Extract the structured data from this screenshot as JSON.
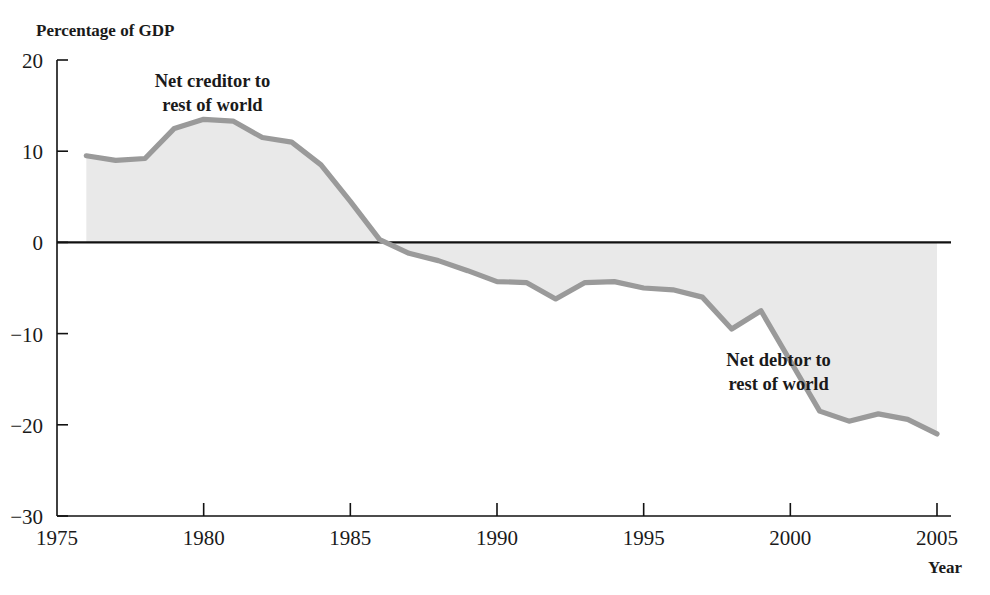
{
  "chart_data": {
    "type": "area",
    "title": "",
    "ylabel": "Percentage of GDP",
    "xlabel": "Year",
    "xlim": [
      1975,
      2005
    ],
    "ylim": [
      -30,
      20
    ],
    "grid": false,
    "legend_position": "none",
    "series_name": "U.S. net international investment position",
    "x": [
      1976,
      1977,
      1978,
      1979,
      1980,
      1981,
      1982,
      1983,
      1984,
      1985,
      1986,
      1987,
      1988,
      1989,
      1990,
      1991,
      1992,
      1993,
      1994,
      1995,
      1996,
      1997,
      1998,
      1999,
      2000,
      2001,
      2002,
      2003,
      2004,
      2005
    ],
    "values": [
      9.5,
      9.0,
      9.2,
      12.5,
      13.5,
      13.3,
      11.5,
      11.0,
      8.5,
      4.5,
      0.3,
      -1.2,
      -2.0,
      -3.1,
      -4.3,
      -4.4,
      -6.2,
      -4.4,
      -4.3,
      -5.0,
      -5.2,
      -6.0,
      -9.5,
      -7.5,
      -13.0,
      -18.5,
      -19.6,
      -18.8,
      -19.4,
      -21.0
    ],
    "y_ticks": [
      20,
      10,
      0,
      -10,
      -20,
      -30
    ],
    "y_tick_labels": [
      "20",
      "10",
      "0",
      "−10",
      "−20",
      "−30"
    ],
    "x_ticks": [
      1975,
      1980,
      1985,
      1990,
      1995,
      2000,
      2005
    ],
    "x_tick_labels": [
      "1975",
      "1980",
      "1985",
      "1990",
      "1995",
      "2000",
      "2005"
    ],
    "zero_crossing_year": 1985.9,
    "annotations": [
      {
        "text_line1": "Net creditor to",
        "text_line2": "rest of world",
        "x": 1980.3,
        "y": 17.0
      },
      {
        "text_line1": "Net debtor to",
        "text_line2": "rest of world",
        "x": 1999.6,
        "y": -13.5
      }
    ],
    "colors": {
      "line": "#9a9a9a",
      "fill": "#e9e9e9",
      "axis": "#111111",
      "text": "#1a1a1a"
    }
  },
  "labels": {
    "y_axis_title": "Percentage of GDP",
    "x_axis_title": "Year",
    "annotation_creditor_line1": "Net creditor to",
    "annotation_creditor_line2": "rest of world",
    "annotation_debtor_line1": "Net debtor to",
    "annotation_debtor_line2": "rest of world"
  }
}
